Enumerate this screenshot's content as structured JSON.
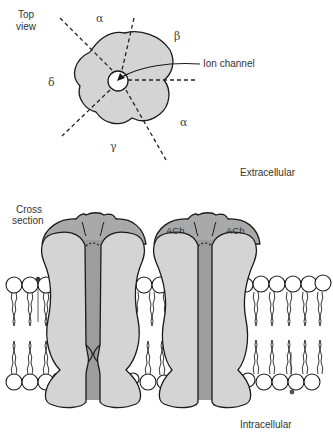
{
  "figure": {
    "colors": {
      "background": "#ffffff",
      "subunit_light": "#d4d4d4",
      "subunit_dark": "#a9a9a9",
      "pore": "#9d9d9d",
      "outline": "#1a1a1a",
      "text": "#333333"
    }
  },
  "top_view": {
    "label_line1": "Top",
    "label_line2": "view",
    "subunits": [
      {
        "name": "alpha",
        "symbol": "α"
      },
      {
        "name": "beta",
        "symbol": "β"
      },
      {
        "name": "alpha",
        "symbol": "α"
      },
      {
        "name": "gamma",
        "symbol": "γ"
      },
      {
        "name": "delta",
        "symbol": "δ"
      }
    ],
    "callout": "Ion channel"
  },
  "regions": {
    "extracellular": "Extracellular",
    "intracellular": "Intracellular"
  },
  "cross_section": {
    "label_line1": "Cross",
    "label_line2": "section",
    "channels": [
      {
        "state": "closed",
        "binding_labels": []
      },
      {
        "state": "open",
        "binding_labels": [
          "ACh",
          "ACh"
        ]
      }
    ]
  }
}
